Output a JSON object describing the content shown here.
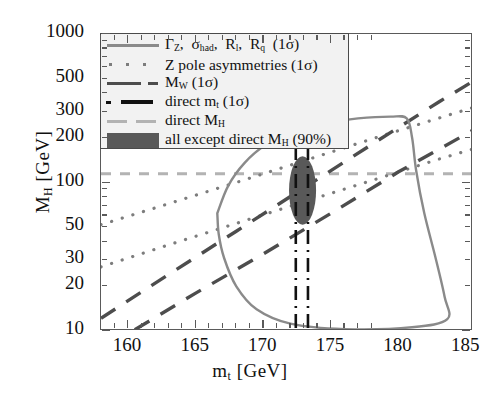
{
  "chart_data": {
    "type": "line",
    "title": "",
    "xlabel": "m_t [GeV]",
    "ylabel": "M_H [GeV]",
    "xlim": [
      158,
      185.5
    ],
    "ylim": [
      10,
      1000
    ],
    "yscale": "log",
    "grid": false,
    "xticks": [
      160,
      165,
      170,
      175,
      180,
      185
    ],
    "yticks": [
      10,
      20,
      30,
      50,
      100,
      200,
      300,
      500,
      1000
    ],
    "legend_position": "upper-left",
    "series": [
      {
        "name": "Gamma_Z, sigma_had, R_l, R_q (1sigma)",
        "style": "solid",
        "color": "#8a8a8a",
        "description": "closed contour band, opens left near m_t=166, closes right near m_t=183",
        "points": [
          [
            166.6,
            62
          ],
          [
            167.4,
            95
          ],
          [
            168.6,
            135
          ],
          [
            170.2,
            180
          ],
          [
            172.0,
            215
          ],
          [
            174.5,
            250
          ],
          [
            177.0,
            270
          ],
          [
            179.4,
            278
          ],
          [
            180.6,
            270
          ],
          [
            181.0,
            200
          ],
          [
            181.3,
            120
          ],
          [
            181.9,
            62
          ],
          [
            182.7,
            32
          ],
          [
            183.4,
            17
          ],
          [
            183.6,
            12
          ],
          [
            181.0,
            10.6
          ],
          [
            176.0,
            10.3
          ],
          [
            172.0,
            11.2
          ],
          [
            169.5,
            14
          ],
          [
            168.0,
            20
          ],
          [
            167.1,
            31
          ],
          [
            166.7,
            45
          ],
          [
            166.6,
            62
          ]
        ]
      },
      {
        "name": "Z pole asymmetries (1sigma)",
        "style": "dotted",
        "color": "#7d7d7d",
        "band_upper": [
          [
            158,
            52
          ],
          [
            163,
            72
          ],
          [
            168,
            100
          ],
          [
            173,
            140
          ],
          [
            178,
            196
          ],
          [
            183,
            272
          ],
          [
            185.5,
            320
          ]
        ],
        "band_lower": [
          [
            158,
            27
          ],
          [
            163,
            38
          ],
          [
            168,
            53
          ],
          [
            173,
            74
          ],
          [
            178,
            103
          ],
          [
            183,
            144
          ],
          [
            185.5,
            168
          ]
        ]
      },
      {
        "name": "M_W (1sigma)",
        "style": "dashed",
        "color": "#4d4d4d",
        "band_upper": [
          [
            158,
            12.2
          ],
          [
            163,
            24
          ],
          [
            168,
            47
          ],
          [
            173,
            92
          ],
          [
            178,
            180
          ],
          [
            183,
            350
          ],
          [
            185.5,
            480
          ]
        ],
        "band_lower": [
          [
            160.5,
            10.2
          ],
          [
            165,
            18
          ],
          [
            170,
            33
          ],
          [
            175,
            62
          ],
          [
            180,
            118
          ],
          [
            185.5,
            225
          ]
        ]
      },
      {
        "name": "direct m_t (1sigma)",
        "style": "dash-dot-vertical",
        "color": "#111111",
        "x_values": [
          172.4,
          173.3
        ]
      },
      {
        "name": "direct M_H",
        "style": "dashed-horizontal",
        "color": "#b3b3b3",
        "y_value": 114.4
      },
      {
        "name": "all except direct M_H (90%)",
        "style": "filled-ellipse",
        "color": "#595959",
        "center": [
          172.9,
          82
        ],
        "semi_x": 1.0,
        "y_range": [
          52,
          150
        ]
      }
    ]
  },
  "axes": {
    "y_label_main": "M",
    "y_label_sub": "H",
    "y_label_unit": "[GeV]",
    "x_label_main": "m",
    "x_label_sub": "t",
    "x_label_unit": "[GeV]",
    "yticks": [
      "1000",
      "500",
      "300",
      "200",
      "100",
      "50",
      "30",
      "20",
      "10"
    ],
    "xticks": [
      "160",
      "165",
      "170",
      "175",
      "180",
      "185"
    ]
  },
  "legend": {
    "items": [
      {
        "key": "solid-line-key",
        "text_parts": [
          "Γ",
          "Z",
          ",  σ",
          "had",
          ",  R",
          "l",
          ",  R",
          "q",
          "  (1σ)"
        ],
        "text": "ΓZ, σhad, Rl, Rq (1σ)"
      },
      {
        "key": "dotted-line-key",
        "text": "Z pole asymmetries (1σ)"
      },
      {
        "key": "dashed-line-key",
        "text_main": "M",
        "text_sub": "W",
        "text_tail": " (1σ)",
        "text": "MW (1σ)"
      },
      {
        "key": "dash-dot-line-key",
        "text_main": "direct m",
        "text_sub": "t",
        "text_tail": " (1σ)",
        "text": "direct mt (1σ)"
      },
      {
        "key": "mh-band-key",
        "text_main": "direct M",
        "text_sub": "H",
        "text_tail": "",
        "text": "direct MH"
      },
      {
        "key": "filled-box-key",
        "text_main": "all except direct M",
        "text_sub": "H",
        "text_tail": " (90%)",
        "text": "all except direct MH (90%)"
      }
    ]
  }
}
